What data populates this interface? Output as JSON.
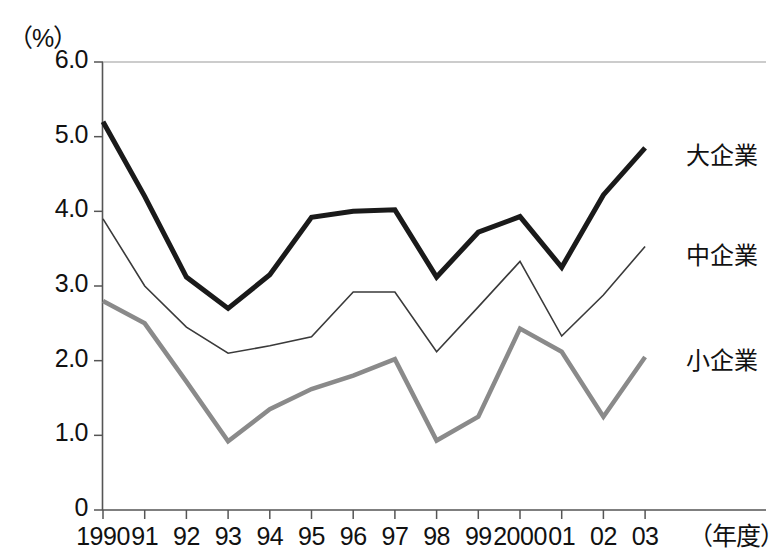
{
  "chart_data": {
    "type": "line",
    "title": "",
    "xlabel": "（年度）",
    "ylabel": "（%）",
    "unit_label": "（%）",
    "x_axis_unit_label": "（年度）",
    "categories": [
      "1990",
      "91",
      "92",
      "93",
      "94",
      "95",
      "96",
      "97",
      "98",
      "99",
      "2000",
      "01",
      "02",
      "03"
    ],
    "years": [
      1990,
      1991,
      1992,
      1993,
      1994,
      1995,
      1996,
      1997,
      1998,
      1999,
      2000,
      2001,
      2002,
      2003
    ],
    "ylim": [
      0,
      6.0
    ],
    "yticks": [
      0,
      1.0,
      2.0,
      3.0,
      4.0,
      5.0,
      6.0
    ],
    "ytick_labels": [
      "0",
      "1.0",
      "2.0",
      "3.0",
      "4.0",
      "5.0",
      "6.0"
    ],
    "grid": false,
    "legend_position": "right-inline",
    "series": [
      {
        "name": "大企業",
        "color": "#1a1a1a",
        "line_width": 5,
        "label_y_value": 4.8,
        "values": [
          5.2,
          4.2,
          3.12,
          2.7,
          3.15,
          3.92,
          4.0,
          4.02,
          3.12,
          3.72,
          3.93,
          3.25,
          4.22,
          4.85
        ]
      },
      {
        "name": "中企業",
        "color": "#3a3a3a",
        "line_width": 1.6,
        "label_y_value": 3.45,
        "values": [
          3.9,
          3.0,
          2.45,
          2.1,
          2.2,
          2.32,
          2.92,
          2.92,
          2.12,
          2.72,
          3.33,
          2.33,
          2.88,
          3.53
        ]
      },
      {
        "name": "小企業",
        "color": "#8a8a8a",
        "line_width": 4.5,
        "label_y_value": 2.05,
        "values": [
          2.8,
          2.5,
          1.72,
          0.92,
          1.35,
          1.62,
          1.8,
          2.02,
          0.93,
          1.25,
          2.43,
          2.12,
          1.25,
          2.05
        ]
      }
    ]
  },
  "axes": {
    "axis_color": "#555555",
    "background": "#ffffff"
  }
}
